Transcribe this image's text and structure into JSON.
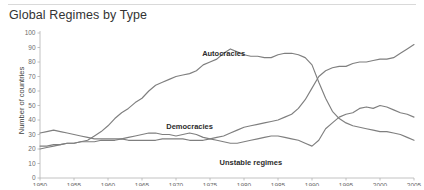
{
  "header": {
    "title": "Global Regimes by Type"
  },
  "chart_data": {
    "type": "line",
    "title": "Global Regimes by Type",
    "xlabel": "",
    "ylabel": "Number of countries",
    "xlim": [
      1950,
      2005
    ],
    "ylim": [
      0,
      100
    ],
    "grid": false,
    "legend_position": "inline-annotations",
    "line_color": "#7f7f7f",
    "axis_color": "#b3b3b3",
    "xticks": [
      1950,
      1955,
      1960,
      1965,
      1970,
      1975,
      1980,
      1985,
      1990,
      1995,
      2000,
      2005
    ],
    "yticks": [
      0,
      10,
      20,
      30,
      40,
      50,
      60,
      70,
      80,
      90,
      100
    ],
    "x": [
      1950,
      1951,
      1952,
      1953,
      1954,
      1955,
      1956,
      1957,
      1958,
      1959,
      1960,
      1961,
      1962,
      1963,
      1964,
      1965,
      1966,
      1967,
      1968,
      1969,
      1970,
      1971,
      1972,
      1973,
      1974,
      1975,
      1976,
      1977,
      1978,
      1979,
      1980,
      1981,
      1982,
      1983,
      1984,
      1985,
      1986,
      1987,
      1988,
      1989,
      1990,
      1991,
      1992,
      1993,
      1994,
      1995,
      1996,
      1997,
      1998,
      1999,
      2000,
      2001,
      2002,
      2003,
      2004,
      2005
    ],
    "series": [
      {
        "name": "Autocracies",
        "label_x": 1977,
        "label_y": 84,
        "values": [
          20,
          21,
          22,
          23,
          24,
          24,
          25,
          26,
          29,
          32,
          36,
          41,
          45,
          48,
          52,
          55,
          60,
          64,
          66,
          68,
          70,
          71,
          72,
          74,
          78,
          80,
          82,
          86,
          89,
          87,
          85,
          84,
          84,
          83,
          83,
          85,
          86,
          86,
          85,
          83,
          78,
          66,
          55,
          46,
          41,
          38,
          36,
          35,
          34,
          33,
          32,
          32,
          31,
          30,
          28,
          26
        ]
      },
      {
        "name": "Democracies",
        "label_x": 1972,
        "label_y": 34,
        "values": [
          22,
          22,
          23,
          23,
          24,
          24,
          25,
          25,
          25,
          26,
          26,
          26,
          27,
          26,
          26,
          26,
          26,
          26,
          27,
          27,
          27,
          27,
          26,
          26,
          26,
          27,
          28,
          29,
          31,
          33,
          35,
          36,
          37,
          38,
          39,
          40,
          42,
          44,
          48,
          54,
          62,
          70,
          74,
          76,
          77,
          77,
          79,
          80,
          80,
          81,
          82,
          82,
          83,
          86,
          89,
          92
        ]
      },
      {
        "name": "Unstable regimes",
        "label_x": 1981,
        "label_y": 9,
        "values": [
          31,
          32,
          33,
          32,
          31,
          30,
          29,
          28,
          27,
          27,
          27,
          27,
          27,
          28,
          29,
          30,
          31,
          31,
          30,
          30,
          29,
          30,
          31,
          30,
          28,
          27,
          26,
          25,
          24,
          24,
          25,
          26,
          27,
          28,
          29,
          29,
          28,
          27,
          26,
          24,
          22,
          26,
          34,
          38,
          42,
          44,
          45,
          48,
          49,
          48,
          50,
          49,
          47,
          45,
          44,
          42
        ]
      }
    ]
  }
}
